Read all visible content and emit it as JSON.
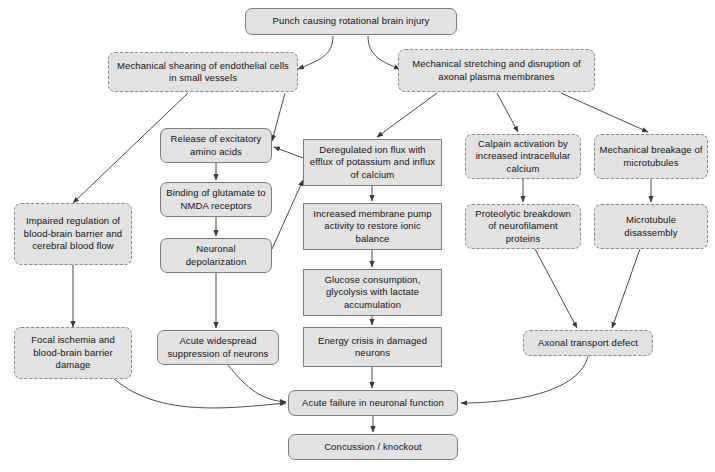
{
  "diagram": {
    "colors": {
      "node_fill": "#e2e2e2",
      "node_border": "#7d7d7d",
      "edge_stroke": "#444444",
      "background": "#ffffff",
      "text": "#111111"
    },
    "nodes": [
      {
        "id": "punch",
        "label": "Punch causing rotational brain injury",
        "x": 245,
        "y": 8,
        "w": 212,
        "h": 27,
        "border": "solid",
        "corner": "round"
      },
      {
        "id": "shearing",
        "label": "Mechanical shearing of endothelial cells in small vessels",
        "x": 108,
        "y": 52,
        "w": 190,
        "h": 40,
        "border": "dashed",
        "corner": "round"
      },
      {
        "id": "stretching",
        "label": "Mechanical stretching and disruption of axonal plasma membranes",
        "x": 398,
        "y": 49,
        "w": 197,
        "h": 43,
        "border": "dashed",
        "corner": "round"
      },
      {
        "id": "excitatory",
        "label": "Release of excitatory amino acids",
        "x": 160,
        "y": 128,
        "w": 112,
        "h": 35,
        "border": "solid",
        "corner": "round"
      },
      {
        "id": "glutamate",
        "label": "Binding of glutamate to NMDA receptors",
        "x": 160,
        "y": 182,
        "w": 112,
        "h": 35,
        "border": "solid",
        "corner": "round"
      },
      {
        "id": "depolarization",
        "label": "Neuronal depolarization",
        "x": 160,
        "y": 238,
        "w": 112,
        "h": 35,
        "border": "solid",
        "corner": "round"
      },
      {
        "id": "suppression",
        "label": "Acute widespread suppression of neurons",
        "x": 157,
        "y": 330,
        "w": 122,
        "h": 35,
        "border": "solid",
        "corner": "round"
      },
      {
        "id": "ionflux",
        "label": "Deregulated ion flux with efflux of potassium and influx of calcium",
        "x": 303,
        "y": 139,
        "w": 139,
        "h": 47,
        "border": "solid",
        "corner": "square"
      },
      {
        "id": "pump",
        "label": "Increased membrane pump activity to restore ionic balance",
        "x": 303,
        "y": 203,
        "w": 139,
        "h": 47,
        "border": "solid",
        "corner": "square"
      },
      {
        "id": "glucose",
        "label": "Glucose consumption, glycolysis with lactate accumulation",
        "x": 303,
        "y": 269,
        "w": 139,
        "h": 47,
        "border": "solid",
        "corner": "square"
      },
      {
        "id": "energy",
        "label": "Energy crisis in damaged neurons",
        "x": 303,
        "y": 327,
        "w": 139,
        "h": 40,
        "border": "solid",
        "corner": "square"
      },
      {
        "id": "calpain",
        "label": "Calpain activation by increased intracellular calcium",
        "x": 465,
        "y": 134,
        "w": 116,
        "h": 45,
        "border": "dashed",
        "corner": "round"
      },
      {
        "id": "proteolytic",
        "label": "Proteolytic breakdown of neurofilament proteins",
        "x": 465,
        "y": 204,
        "w": 116,
        "h": 45,
        "border": "dashed",
        "corner": "round"
      },
      {
        "id": "breakage",
        "label": "Mechanical breakage of microtubules",
        "x": 594,
        "y": 134,
        "w": 114,
        "h": 45,
        "border": "dashed",
        "corner": "round"
      },
      {
        "id": "disassembly",
        "label": "Microtubule disassembly",
        "x": 594,
        "y": 204,
        "w": 114,
        "h": 45,
        "border": "dashed",
        "corner": "round"
      },
      {
        "id": "transport",
        "label": "Axonal transport defect",
        "x": 523,
        "y": 330,
        "w": 130,
        "h": 26,
        "border": "dashed",
        "corner": "round"
      },
      {
        "id": "failure",
        "label": "Acute failure in neuronal function",
        "x": 288,
        "y": 390,
        "w": 170,
        "h": 26,
        "border": "solid",
        "corner": "round"
      },
      {
        "id": "concussion",
        "label": "Concussion / knockout",
        "x": 288,
        "y": 434,
        "w": 170,
        "h": 26,
        "border": "solid",
        "corner": "round"
      }
    ],
    "edges": [
      {
        "id": "punch-to-shearing",
        "from": "punch",
        "to": "shearing",
        "path": "M 333 36 C 333 55, 320 60, 298 69"
      },
      {
        "id": "punch-to-stretching",
        "from": "punch",
        "to": "stretching",
        "path": "M 368 36 C 368 56, 382 62, 400 69"
      },
      {
        "id": "shearing-to-impaired",
        "from": "shearing",
        "to": "impaired",
        "path": "M 188 93 L 73 203"
      },
      {
        "id": "shearing-to-excitatory",
        "from": "shearing",
        "to": "excitatory",
        "path": "M 285 93 L 272 141"
      },
      {
        "id": "stretching-to-ionflux",
        "from": "stretching",
        "to": "ionflux",
        "path": "M 437 93 L 377 137"
      },
      {
        "id": "stretching-to-calpain",
        "from": "stretching",
        "to": "calpain",
        "path": "M 497 93 L 518 132"
      },
      {
        "id": "stretching-to-breakage",
        "from": "stretching",
        "to": "breakage",
        "path": "M 561 93 L 648 132"
      },
      {
        "id": "impaired-to-focal",
        "from": "impaired",
        "to": "focal",
        "path": "M 73 265 L 73 327"
      },
      {
        "id": "excitatory-to-glutamate",
        "from": "excitatory",
        "to": "glutamate",
        "path": "M 216 163 L 216 180"
      },
      {
        "id": "glutamate-to-depolarization",
        "from": "glutamate",
        "to": "depolarization",
        "path": "M 216 217 L 216 236"
      },
      {
        "id": "depolarization-to-suppression",
        "from": "depolarization",
        "to": "suppression",
        "path": "M 216 273 L 216 328"
      },
      {
        "id": "depolarization-to-ionflux",
        "from": "depolarization",
        "to": "ionflux",
        "path": "M 272 249 L 303 180"
      },
      {
        "id": "ionflux-to-excitatory",
        "from": "ionflux",
        "to": "excitatory",
        "path": "M 303 158 L 274 147"
      },
      {
        "id": "ionflux-to-pump",
        "from": "ionflux",
        "to": "pump",
        "path": "M 372 186 L 372 201"
      },
      {
        "id": "pump-to-glucose",
        "from": "pump",
        "to": "glucose",
        "path": "M 372 250 L 372 267"
      },
      {
        "id": "glucose-to-energy",
        "from": "glucose",
        "to": "energy",
        "path": "M 372 316 L 372 325"
      },
      {
        "id": "energy-to-failure",
        "from": "energy",
        "to": "failure",
        "path": "M 372 367 L 372 388"
      },
      {
        "id": "calpain-to-proteolytic",
        "from": "calpain",
        "to": "proteolytic",
        "path": "M 523 179 L 523 202"
      },
      {
        "id": "breakage-to-disassembly",
        "from": "breakage",
        "to": "disassembly",
        "path": "M 651 179 L 651 202"
      },
      {
        "id": "proteolytic-to-transport",
        "from": "proteolytic",
        "to": "transport",
        "path": "M 535 249 L 577 328"
      },
      {
        "id": "disassembly-to-transport",
        "from": "disassembly",
        "to": "transport",
        "path": "M 640 249 L 612 328"
      },
      {
        "id": "focal-to-failure",
        "from": "focal",
        "to": "failure",
        "path": "M 105 370 C 150 420, 230 408, 286 403"
      },
      {
        "id": "suppression-to-failure",
        "from": "suppression",
        "to": "failure",
        "path": "M 228 365 C 248 390, 262 400, 286 402"
      },
      {
        "id": "transport-to-failure",
        "from": "transport",
        "to": "failure",
        "path": "M 588 356 C 580 390, 520 403, 461 403"
      },
      {
        "id": "failure-to-concussion",
        "from": "failure",
        "to": "concussion",
        "path": "M 373 416 L 373 432"
      }
    ],
    "extra_nodes": [
      {
        "id": "impaired",
        "label": "Impaired regulation of blood-brain barrier and cerebral blood flow",
        "x": 14,
        "y": 203,
        "w": 118,
        "h": 62,
        "border": "dashed",
        "corner": "round"
      },
      {
        "id": "focal",
        "label": "Focal ischemia and blood-brain barrier damage",
        "x": 14,
        "y": 327,
        "w": 118,
        "h": 52,
        "border": "dashed",
        "corner": "round"
      }
    ]
  }
}
